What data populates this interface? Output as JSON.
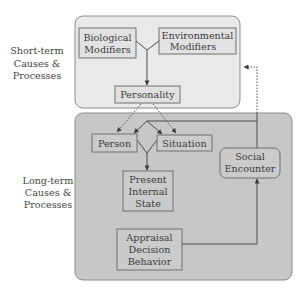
{
  "colors": {
    "short_term_fill": "#e9e9e9",
    "long_term_fill": "#c7c7c7",
    "group_stroke": "#8c8c8c",
    "short_node_fill": "#e2e2e2",
    "long_node_fill": "#cbcbcb",
    "node_stroke": "#6e6e6e"
  },
  "groups": {
    "short_term": {
      "lines": [
        "Short-term",
        "Causes &",
        "Processes"
      ]
    },
    "long_term": {
      "lines": [
        "Long-term",
        "Causes &",
        "Processes"
      ]
    }
  },
  "nodes": {
    "biological_modifiers": {
      "lines": [
        "Biological",
        "Modifiers"
      ]
    },
    "environmental_modifiers": {
      "lines": [
        "Environmental",
        "Modifiers"
      ]
    },
    "personality": {
      "lines": [
        "Personality"
      ]
    },
    "person": {
      "lines": [
        "Person"
      ]
    },
    "situation": {
      "lines": [
        "Situation"
      ]
    },
    "present_internal_state": {
      "lines": [
        "Present",
        "Internal",
        "State"
      ]
    },
    "social_encounter": {
      "lines": [
        "Social",
        "Encounter"
      ]
    },
    "appraisal_decision_behavior": {
      "lines": [
        "Appraisal",
        "Decision",
        "Behavior"
      ]
    }
  },
  "edges": [
    {
      "from": "Biological Modifiers",
      "to": "Personality",
      "style": "solid"
    },
    {
      "from": "Environmental Modifiers",
      "to": "Personality",
      "style": "solid"
    },
    {
      "from": "Personality",
      "to": "Person",
      "style": "dotted"
    },
    {
      "from": "Personality",
      "to": "Situation",
      "style": "dotted"
    },
    {
      "from": "Social Encounter",
      "to": "Person",
      "style": "solid"
    },
    {
      "from": "Social Encounter",
      "to": "Situation",
      "style": "solid"
    },
    {
      "from": "Social Encounter",
      "to": "Short-term Causes & Processes",
      "style": "dotted"
    },
    {
      "from": "Person",
      "to": "Present Internal State",
      "style": "solid"
    },
    {
      "from": "Situation",
      "to": "Present Internal State",
      "style": "solid"
    },
    {
      "from": "Appraisal Decision Behavior",
      "to": "Social Encounter",
      "style": "solid"
    }
  ]
}
